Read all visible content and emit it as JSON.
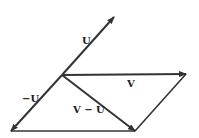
{
  "diagram": {
    "origin": [
      62,
      75
    ],
    "vectors": [
      {
        "id": "U",
        "label": "U",
        "from": [
          62,
          75
        ],
        "to": [
          114,
          17
        ],
        "label_pos": [
          82,
          44
        ],
        "arrow": true
      },
      {
        "id": "V",
        "label": "V",
        "from": [
          62,
          75
        ],
        "to": [
          186,
          74
        ],
        "label_pos": [
          127,
          87
        ],
        "arrow": true
      },
      {
        "id": "neg-U",
        "label": "−U",
        "from": [
          62,
          75
        ],
        "to": [
          11,
          131
        ],
        "label_pos": [
          22,
          102
        ],
        "arrow": true
      },
      {
        "id": "V-minus-U",
        "label": "V − U",
        "from": [
          62,
          75
        ],
        "to": [
          135,
          131
        ],
        "label_pos": [
          73,
          113
        ],
        "arrow": true
      }
    ],
    "edges": [
      {
        "id": "bottom-edge",
        "from": [
          11,
          131
        ],
        "to": [
          135,
          131
        ]
      },
      {
        "id": "right-edge",
        "from": [
          135,
          131
        ],
        "to": [
          186,
          74
        ]
      }
    ],
    "stroke_color": "#333333"
  }
}
